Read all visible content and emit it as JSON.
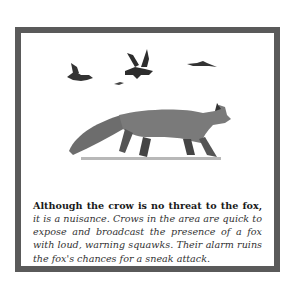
{
  "figure": {
    "illustration": {
      "subject": "red fox walking, crows flying overhead",
      "elements": [
        "crow-left",
        "crow-center",
        "crow-small",
        "crow-right",
        "fox"
      ]
    },
    "caption": {
      "bold_text": "Although the crow is no threat to the fox,",
      "italic_text": " it is a nuisance. Crows in the area are quick to expose and broadcast the presence of a fox with loud, warning squawks. Their alarm ruins the fox's chances for a sneak attack."
    },
    "colors": {
      "border": "#5a5a5a",
      "background": "#ffffff",
      "ink": "#222222"
    }
  }
}
